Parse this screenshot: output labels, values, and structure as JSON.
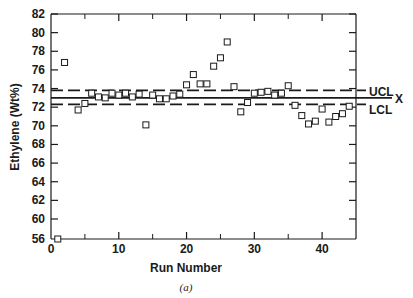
{
  "chart_data": {
    "type": "scatter",
    "title": "",
    "caption": "(a)",
    "xlabel": "Run Number",
    "ylabel": "Ethylene (Wt%)",
    "xlim": [
      0,
      45
    ],
    "ylim": [
      56,
      82
    ],
    "y_axis_break": "between 56 and 60",
    "x_ticks": [
      0,
      10,
      20,
      30,
      40
    ],
    "x_minor_ticks": [
      5,
      15,
      25,
      35
    ],
    "y_ticks": [
      56,
      60,
      62,
      64,
      66,
      68,
      70,
      72,
      74,
      76,
      78,
      80,
      82
    ],
    "grid": false,
    "marker": "open-square",
    "control_lines": [
      {
        "name": "UCL",
        "label": "UCL",
        "value": 73.8,
        "style": "dashed"
      },
      {
        "name": "center",
        "label": "X",
        "value": 73.0,
        "style": "solid"
      },
      {
        "name": "LCL",
        "label": "LCL",
        "value": 72.3,
        "style": "dashed"
      }
    ],
    "series": [
      {
        "name": "Ethylene",
        "x": [
          1,
          2,
          4,
          5,
          6,
          7,
          8,
          9,
          10,
          11,
          12,
          13,
          14,
          15,
          16,
          17,
          18,
          19,
          20,
          21,
          22,
          23,
          24,
          25,
          26,
          27,
          28,
          29,
          30,
          31,
          32,
          33,
          34,
          35,
          36,
          37,
          38,
          39,
          40,
          41,
          42,
          43,
          44
        ],
        "y": [
          56.0,
          76.8,
          71.7,
          72.4,
          73.5,
          73.1,
          73.0,
          73.5,
          73.3,
          73.5,
          73.1,
          73.4,
          70.1,
          73.3,
          72.9,
          72.9,
          73.2,
          73.4,
          74.4,
          75.5,
          74.5,
          74.5,
          76.4,
          77.3,
          79.0,
          74.2,
          71.5,
          72.5,
          73.5,
          73.6,
          73.7,
          73.3,
          73.5,
          74.3,
          72.2,
          71.1,
          70.2,
          70.5,
          71.8,
          70.4,
          71.0,
          71.3,
          72.1
        ]
      }
    ]
  },
  "labels": {
    "xlabel": "Run Number",
    "ylabel": "Ethylene (Wt%)",
    "caption": "(a)",
    "ucl": "UCL",
    "center": "X",
    "lcl": "LCL"
  }
}
